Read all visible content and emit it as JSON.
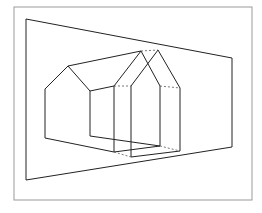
{
  "figure": {
    "colors": {
      "background": "#ffffff",
      "frame": "#9a9a9a",
      "lines": "#222222",
      "hidden_lines": "#555555"
    },
    "frame": {
      "x": 14,
      "y": 7,
      "w": 238,
      "h": 193
    },
    "plane": {
      "points": "26,19 232,58 232,147 26,180"
    },
    "back_house": {
      "outline": "45,138 45,89 68,66 90,91 90,136",
      "ridge_to_front": "68,66 141,51",
      "eave_link": "90,91 114,86",
      "base_link_left": "45,138 114,152",
      "base_link_right": "90,136 160,146"
    },
    "front_house": {
      "front_face": "114,152 114,86 141,51 130,52",
      "left_wall": "114,86 114,152",
      "right_wall": "131,86 131,157",
      "roof_left": "114,86 141,51",
      "roof_right": "141,51 160,86",
      "second_roof_left": "131,86 158,50",
      "second_roof_right": "158,50 180,88",
      "far_wall": "180,88 180,151",
      "near_wall": "160,86 160,146",
      "base_front": "131,157 180,151",
      "base_back": "114,152 160,146"
    },
    "dashed": [
      "114,86 131,86",
      "160,86 180,88",
      "141,51 158,50",
      "114,152 131,157",
      "160,146 180,151"
    ]
  }
}
